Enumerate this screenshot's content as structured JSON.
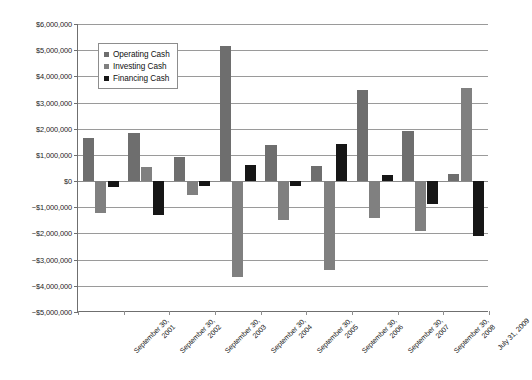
{
  "chart_data": {
    "type": "bar",
    "title": "",
    "subtitle": "",
    "xlabel": "",
    "ylabel": "",
    "grid": true,
    "legend_position": "top-left-inside",
    "ylim": [
      -5000000,
      6000000
    ],
    "ytick_step": 1000000,
    "ytick_labels": [
      "$6,000,000",
      "$5,000,000",
      "$4,000,000",
      "$3,000,000",
      "$2,000,000",
      "$1,000,000",
      "$0",
      "−$1,000,000",
      "−$2,000,000",
      "−$3,000,000",
      "−$4,000,000",
      "−$5,000,000"
    ],
    "ytick_values": [
      6000000,
      5000000,
      4000000,
      3000000,
      2000000,
      1000000,
      0,
      -1000000,
      -2000000,
      -3000000,
      -4000000,
      -5000000
    ],
    "categories": [
      "September 30, 2001",
      "September 30, 2002",
      "September 30, 2003",
      "September 30, 2004",
      "September 30, 2005",
      "September 30, 2006",
      "September 30, 2007",
      "September 30, 2008",
      "July 31, 2009"
    ],
    "category_lines": [
      [
        "September 30,",
        "2001"
      ],
      [
        "September 30,",
        "2002"
      ],
      [
        "September 30,",
        "2003"
      ],
      [
        "September 30,",
        "2004"
      ],
      [
        "September 30,",
        "2005"
      ],
      [
        "September 30,",
        "2006"
      ],
      [
        "September 30,",
        "2007"
      ],
      [
        "September 30,",
        "2008"
      ],
      [
        "July 31, 2009",
        ""
      ]
    ],
    "series": [
      {
        "name": "Operating Cash",
        "color": "#6e6e6e",
        "values": [
          1630000,
          1840000,
          930000,
          5150000,
          1390000,
          560000,
          3490000,
          1910000,
          260000
        ]
      },
      {
        "name": "Investing Cash",
        "color": "#808080",
        "values": [
          -1210000,
          530000,
          -530000,
          -3680000,
          -1490000,
          -3400000,
          -1410000,
          -1910000,
          3550000
        ]
      },
      {
        "name": "Financing Cash",
        "color": "#161616",
        "values": [
          -240000,
          -1280000,
          -200000,
          600000,
          -190000,
          1410000,
          240000,
          -860000,
          -2090000
        ]
      }
    ]
  },
  "legend": {
    "items": [
      {
        "label": "Operating Cash",
        "swatch": "operating"
      },
      {
        "label": "Investing Cash",
        "swatch": "investing"
      },
      {
        "label": "Financing Cash",
        "swatch": "financing"
      }
    ]
  }
}
